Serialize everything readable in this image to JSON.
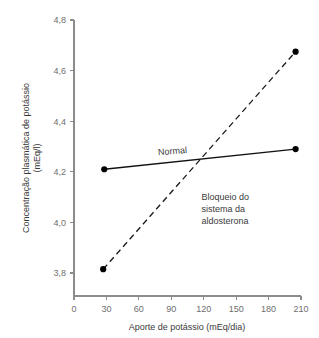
{
  "chart_data": {
    "type": "line",
    "title": "",
    "xlabel": "Aporte de potássio (mEq/dia)",
    "ylabel": "Concentração plasmática de potássio (mEq/l)",
    "ylabel_line1": "Concentração plasmática de potássio",
    "ylabel_line2": "(mEq/l)",
    "xlim": [
      0,
      210
    ],
    "ylim": [
      3.8,
      4.8
    ],
    "xticks": [
      0,
      30,
      60,
      90,
      120,
      150,
      180,
      210
    ],
    "xtick_labels": [
      "0",
      "30",
      "60",
      "90",
      "120",
      "150",
      "180",
      "210"
    ],
    "yticks": [
      3.8,
      4.0,
      4.2,
      4.4,
      4.6,
      4.8
    ],
    "ytick_labels": [
      "3,8",
      "4,0",
      "4,2",
      "4,4",
      "4,6",
      "4,8"
    ],
    "grid": false,
    "legend_position": "inline-annotations",
    "series": [
      {
        "name": "Normal",
        "style": "solid",
        "color": "#111111",
        "markers": true,
        "x": [
          28,
          205
        ],
        "values": [
          4.21,
          4.29
        ]
      },
      {
        "name": "Bloqueio do sistema da aldosterona",
        "style": "dashed",
        "color": "#1a1a1a",
        "markers": true,
        "x": [
          27,
          205
        ],
        "values": [
          3.815,
          4.675
        ]
      }
    ],
    "annotations": [
      {
        "name": "normal-label",
        "text": "Normal",
        "x": 78,
        "y": 4.265,
        "rotation": -5
      },
      {
        "name": "blockade-label",
        "lines": [
          "Bloqueio do",
          "sistema da",
          "aldosterona"
        ],
        "x": 118,
        "y": 4.09,
        "rotation": 0
      }
    ]
  }
}
